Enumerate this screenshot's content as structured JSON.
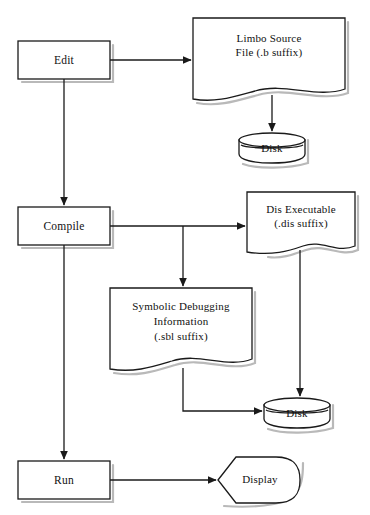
{
  "diagram": {
    "background_color": "#ffffff",
    "line_color": "#1a1a1a",
    "shadow_color": "#b9b9b9",
    "nodes": [
      {
        "id": "edit",
        "kind": "process",
        "label": "Edit",
        "x": 18,
        "y": 41,
        "w": 92,
        "h": 38
      },
      {
        "id": "source",
        "kind": "document",
        "label": "Limbo Source\nFile (.b suffix)",
        "x": 193,
        "y": 18,
        "w": 152,
        "h": 82
      },
      {
        "id": "disk_top",
        "kind": "disk",
        "label": "Disk",
        "x": 239,
        "y": 133,
        "w": 66,
        "h": 28
      },
      {
        "id": "compile",
        "kind": "process",
        "label": "Compile",
        "x": 18,
        "y": 207,
        "w": 92,
        "h": 38
      },
      {
        "id": "dis",
        "kind": "document",
        "label": "Dis Executable\n(.dis suffix)",
        "x": 247,
        "y": 192,
        "w": 108,
        "h": 62
      },
      {
        "id": "sbl",
        "kind": "document",
        "label": "Symbolic Debugging\nInformation\n(.sbl suffix)",
        "x": 110,
        "y": 288,
        "w": 142,
        "h": 82
      },
      {
        "id": "disk_bottom",
        "kind": "disk",
        "label": "Disk",
        "x": 264,
        "y": 398,
        "w": 66,
        "h": 28
      },
      {
        "id": "run",
        "kind": "process",
        "label": "Run",
        "x": 18,
        "y": 461,
        "w": 92,
        "h": 38
      },
      {
        "id": "display",
        "kind": "display",
        "label": "Display",
        "x": 218,
        "y": 455,
        "w": 82,
        "h": 48
      }
    ],
    "edges": [
      {
        "id": "edit-to-source",
        "from": "edit",
        "to": "source",
        "label": ""
      },
      {
        "id": "edit-to-compile",
        "from": "edit",
        "to": "compile",
        "label": ""
      },
      {
        "id": "source-to-disk",
        "from": "source",
        "to": "disk_top",
        "label": ""
      },
      {
        "id": "compile-to-dis",
        "from": "compile",
        "to": "dis",
        "label": ""
      },
      {
        "id": "compile-to-sbl",
        "from": "compile",
        "to": "sbl",
        "label": ""
      },
      {
        "id": "compile-to-run",
        "from": "compile",
        "to": "run",
        "label": ""
      },
      {
        "id": "dis-to-disk",
        "from": "dis",
        "to": "disk_bottom",
        "label": ""
      },
      {
        "id": "sbl-to-disk",
        "from": "sbl",
        "to": "disk_bottom",
        "label": ""
      },
      {
        "id": "run-to-display",
        "from": "run",
        "to": "display",
        "label": ""
      }
    ]
  },
  "labels": {
    "edit": "Edit",
    "source_line1": "Limbo Source",
    "source_line2": "File (.b suffix)",
    "disk_top": "Disk",
    "compile": "Compile",
    "dis_line1": "Dis  Executable",
    "dis_line2": "(.dis suffix)",
    "sbl_line1": "Symbolic  Debugging",
    "sbl_line2": "Information",
    "sbl_line3": "(.sbl suffix)",
    "disk_bottom": "Disk",
    "run": "Run",
    "display": "Display"
  }
}
